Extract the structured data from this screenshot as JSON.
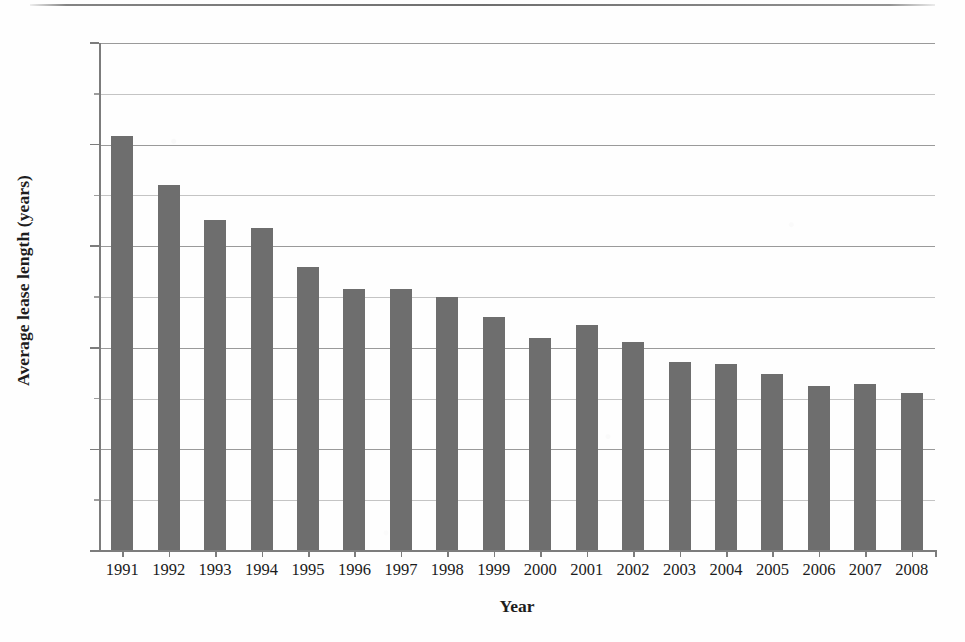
{
  "chart_data": {
    "type": "bar",
    "title": "",
    "xlabel": "Year",
    "ylabel": "Average lease length (years)",
    "categories": [
      "1991",
      "1992",
      "1993",
      "1994",
      "1995",
      "1996",
      "1997",
      "1998",
      "1999",
      "2000",
      "2001",
      "2002",
      "2003",
      "2004",
      "2005",
      "2006",
      "2007",
      "2008"
    ],
    "values": [
      20.4,
      18.0,
      16.3,
      15.9,
      14.0,
      12.9,
      12.9,
      12.5,
      11.5,
      10.5,
      11.1,
      10.3,
      9.3,
      9.2,
      8.7,
      8.1,
      8.2,
      7.8
    ],
    "series": [
      {
        "name": "Average lease length",
        "values": [
          20.4,
          18.0,
          16.3,
          15.9,
          14.0,
          12.9,
          12.9,
          12.5,
          11.5,
          10.5,
          11.1,
          10.3,
          9.3,
          9.2,
          8.7,
          8.1,
          8.2,
          7.8
        ]
      }
    ],
    "ylim": [
      0,
      25
    ],
    "ytick_labels": [
      "0",
      "5",
      "10",
      "15",
      "20",
      "25"
    ],
    "ytick_values": [
      0,
      5,
      10,
      15,
      20,
      25
    ],
    "yminor_values": [
      2.5,
      7.5,
      12.5,
      17.5,
      22.5
    ],
    "grid": "horizontal",
    "legend": "none",
    "bar_color": "#6e6e6e",
    "gridline_color": "#9a9a9a",
    "axis_color": "#7c7c7c"
  },
  "axes": {
    "y_title": "Average lease length (years)",
    "x_title": "Year"
  },
  "ticks": {
    "y": [
      {
        "label": "25",
        "value": 25,
        "minor": false
      },
      {
        "label": "",
        "value": 22.5,
        "minor": true
      },
      {
        "label": "20",
        "value": 20,
        "minor": false
      },
      {
        "label": "",
        "value": 17.5,
        "minor": true
      },
      {
        "label": "15",
        "value": 15,
        "minor": false
      },
      {
        "label": "",
        "value": 12.5,
        "minor": true
      },
      {
        "label": "10",
        "value": 10,
        "minor": false
      },
      {
        "label": "",
        "value": 7.5,
        "minor": true
      },
      {
        "label": "5",
        "value": 5,
        "minor": false
      },
      {
        "label": "",
        "value": 2.5,
        "minor": true
      },
      {
        "label": "0",
        "value": 0,
        "minor": false
      }
    ]
  }
}
